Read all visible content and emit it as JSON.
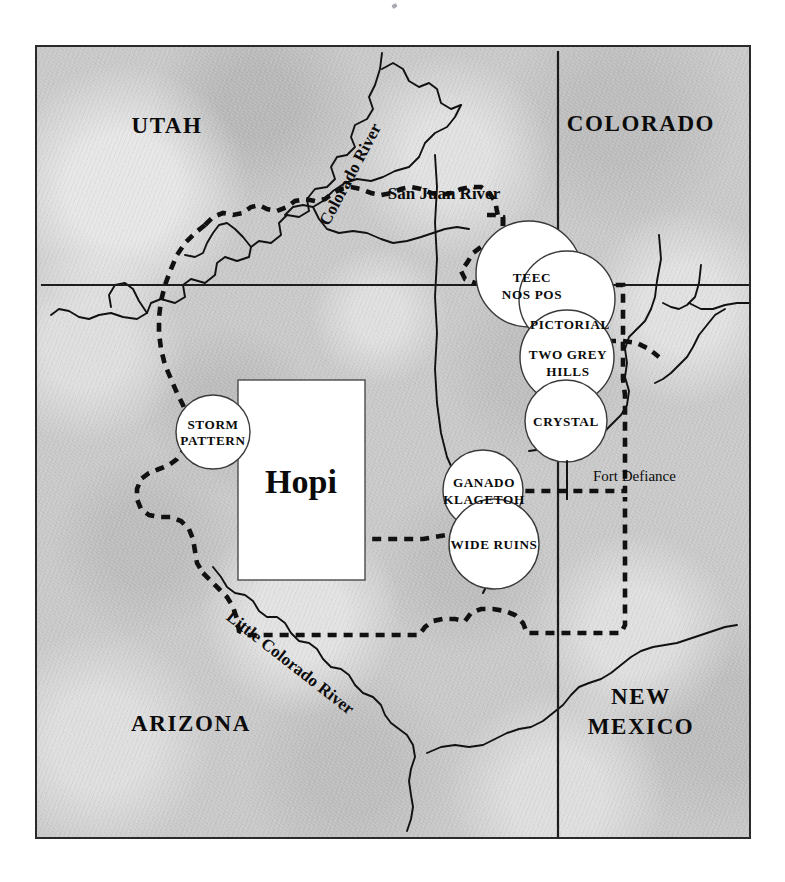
{
  "map": {
    "title": "Navajo and Hopi Weaving Regions",
    "background_color": "#c8c8c8",
    "frame_color": "#2a2a2a",
    "states": [
      {
        "id": "utah",
        "label": "UTAH",
        "x": 165,
        "y": 128
      },
      {
        "id": "colorado",
        "label": "COLORADO",
        "x": 640,
        "y": 126
      },
      {
        "id": "arizona",
        "label": "ARIZONA",
        "x": 188,
        "y": 727
      },
      {
        "id": "new-mexico-1",
        "label": "NEW",
        "x": 638,
        "y": 700
      },
      {
        "id": "new-mexico-2",
        "label": "MEXICO",
        "x": 638,
        "y": 730
      }
    ],
    "rivers": [
      {
        "id": "colorado-river",
        "label": "Colorado River",
        "rotation": -62
      },
      {
        "id": "san-juan-river",
        "label": "San Juan River",
        "rotation": 0
      },
      {
        "id": "little-colorado-river",
        "label": "Little Colorado River",
        "rotation": 38
      }
    ],
    "hopi": {
      "label": "Hopi"
    },
    "fort": {
      "label": "Fort Defiance"
    },
    "weaving_regions": [
      {
        "id": "storm-pattern",
        "lines": [
          "STORM",
          "PATTERN"
        ],
        "cx": 211,
        "cy": 430,
        "r": 37
      },
      {
        "id": "teec-nos-pos",
        "lines": [
          "TEEC",
          "NOS POS"
        ],
        "cx": 527,
        "cy": 272,
        "r": 53
      },
      {
        "id": "pictorial",
        "lines": [
          "PICTORIAL"
        ],
        "cx": 565,
        "cy": 297,
        "r": 48
      },
      {
        "id": "two-grey-hills",
        "lines": [
          "TWO GREY",
          "HILLS"
        ],
        "cx": 565,
        "cy": 355,
        "r": 47
      },
      {
        "id": "crystal",
        "lines": [
          "CRYSTAL"
        ],
        "cx": 564,
        "cy": 419,
        "r": 41
      },
      {
        "id": "ganado-klagetoh",
        "lines": [
          "GANADO",
          "KLAGETOH"
        ],
        "cx": 481,
        "cy": 488,
        "r": 40
      },
      {
        "id": "wide-ruins",
        "lines": [
          "WIDE RUINS"
        ],
        "cx": 492,
        "cy": 542,
        "r": 45
      }
    ],
    "legend_note": "White circles mark Navajo regional weaving styles; white rectangle marks the Hopi Reservation."
  }
}
